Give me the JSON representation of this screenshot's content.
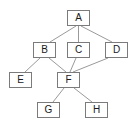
{
  "diagram": {
    "type": "node-link-graph",
    "title": "",
    "canvas": {
      "width": 134,
      "height": 124,
      "background": "#ffffff"
    },
    "style": {
      "node_border_color": "#7b7b7b",
      "node_fill_color": "#ffffff",
      "node_text_color": "#1a1a1a",
      "edge_color": "#9a9a9a",
      "edge_width": 1,
      "node_width": 23,
      "node_height": 16
    },
    "nodes": [
      {
        "id": "A",
        "label": "A",
        "x": 67,
        "y": 10,
        "w": 23,
        "h": 16,
        "cx": 78.5,
        "cy": 18
      },
      {
        "id": "B",
        "label": "B",
        "x": 33,
        "y": 42,
        "w": 23,
        "h": 16,
        "cx": 44.5,
        "cy": 50
      },
      {
        "id": "C",
        "label": "C",
        "x": 67,
        "y": 42,
        "w": 23,
        "h": 16,
        "cx": 78.5,
        "cy": 50
      },
      {
        "id": "D",
        "label": "D",
        "x": 105,
        "y": 42,
        "w": 23,
        "h": 16,
        "cx": 116.5,
        "cy": 50
      },
      {
        "id": "E",
        "label": "E",
        "x": 9,
        "y": 72,
        "w": 23,
        "h": 16,
        "cx": 20.5,
        "cy": 80
      },
      {
        "id": "F",
        "label": "F",
        "x": 57,
        "y": 72,
        "w": 23,
        "h": 16,
        "cx": 68.5,
        "cy": 80
      },
      {
        "id": "G",
        "label": "G",
        "x": 37,
        "y": 102,
        "w": 23,
        "h": 16,
        "cx": 48.5,
        "cy": 110
      },
      {
        "id": "H",
        "label": "H",
        "x": 85,
        "y": 102,
        "w": 23,
        "h": 16,
        "cx": 96.5,
        "cy": 110
      }
    ],
    "edges": [
      {
        "id": "A-B",
        "from": "A",
        "to": "B",
        "x1": 76,
        "y1": 26,
        "x2": 50,
        "y2": 42
      },
      {
        "id": "A-C",
        "from": "A",
        "to": "C",
        "x1": 78.5,
        "y1": 26,
        "x2": 78.5,
        "y2": 42
      },
      {
        "id": "A-D",
        "from": "A",
        "to": "D",
        "x1": 81,
        "y1": 26,
        "x2": 112,
        "y2": 42
      },
      {
        "id": "B-E",
        "from": "B",
        "to": "E",
        "x1": 40,
        "y1": 58,
        "x2": 25,
        "y2": 72
      },
      {
        "id": "B-F",
        "from": "B",
        "to": "F",
        "x1": 49,
        "y1": 58,
        "x2": 66,
        "y2": 72
      },
      {
        "id": "C-F",
        "from": "C",
        "to": "F",
        "x1": 76,
        "y1": 58,
        "x2": 70,
        "y2": 72
      },
      {
        "id": "D-F",
        "from": "D",
        "to": "F",
        "x1": 108,
        "y1": 58,
        "x2": 73,
        "y2": 72
      },
      {
        "id": "F-G",
        "from": "F",
        "to": "G",
        "x1": 64,
        "y1": 88,
        "x2": 53,
        "y2": 102
      },
      {
        "id": "F-H",
        "from": "F",
        "to": "H",
        "x1": 74,
        "y1": 88,
        "x2": 92,
        "y2": 102
      }
    ]
  }
}
